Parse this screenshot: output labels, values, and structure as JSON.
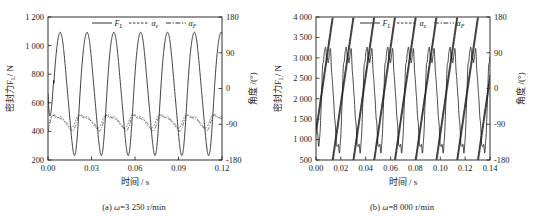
{
  "figure": {
    "panels": [
      {
        "id": "a",
        "caption_prefix": "(a) ",
        "caption_var": "ω",
        "caption_rest": "=3 250 r/min",
        "xlabel": "时间 / s",
        "ylabel_left": "密封力F",
        "ylabel_left_sub": "L",
        "ylabel_left_unit": "/ N",
        "ylabel_right": "角度 /(°)",
        "legend": [
          {
            "label": "F",
            "sub": "L",
            "style": "solid"
          },
          {
            "label": "α",
            "sub": "e",
            "style": "dashed"
          },
          {
            "label": "α",
            "sub": "F",
            "style": "dashdot"
          }
        ],
        "chart_data": {
          "type": "line",
          "title": "",
          "xlabel": "时间 / s",
          "ylabel": "密封力F_L / N",
          "ylabel_right": "角度 /(°)",
          "xlim": [
            0.0,
            0.12
          ],
          "ylim": [
            200,
            1200
          ],
          "ylim_right": [
            -180,
            180
          ],
          "xticks": [
            "0.00",
            "0.03",
            "0.06",
            "0.09",
            "0.12"
          ],
          "xtick_values": [
            0.0,
            0.03,
            0.06,
            0.09,
            0.12
          ],
          "yticks": [
            "200",
            "400",
            "600",
            "800",
            "1 000",
            "1 200"
          ],
          "ytick_values": [
            200,
            400,
            600,
            800,
            1000,
            1200
          ],
          "yticks_right": [
            "-180",
            "-90",
            "0",
            "90",
            "180"
          ],
          "ytick_right_values": [
            -180,
            -90,
            0,
            90,
            180
          ],
          "grid": false,
          "legend_position": "top-center",
          "series": [
            {
              "name": "F_L",
              "axis": "left",
              "style": "solid",
              "period": 0.0185,
              "min": 270,
              "max": 1110,
              "description": "Quasi-sinusoidal seal force, 6.5 cycles over 0-0.12 s, starting near 1150 N at t=0 and decaying into steady oscillation between about 270 N and 1110 N."
            },
            {
              "name": "alpha_e",
              "axis": "right",
              "style": "dashed",
              "period": 0.0185,
              "min": -98,
              "max": -60,
              "description": "Small-amplitude wavy curve near -90 deg, plotted in the band equivalent to 420-530 N on the left axis."
            },
            {
              "name": "alpha_F",
              "axis": "right",
              "style": "dashdot",
              "period": 0.0185,
              "min": -100,
              "max": -62,
              "description": "Nearly overlapping alpha_e, slightly lower, same period."
            }
          ]
        }
      },
      {
        "id": "b",
        "caption_prefix": "(b) ",
        "caption_var": "ω",
        "caption_rest": "=8 000 r/min",
        "xlabel": "时间 / s",
        "ylabel_left": "密封力F",
        "ylabel_left_sub": "L",
        "ylabel_left_unit": "/ N",
        "ylabel_right": "角度 /(°)",
        "legend": [
          {
            "label": "F",
            "sub": "L",
            "style": "solid"
          },
          {
            "label": "α",
            "sub": "e",
            "style": "dashed"
          },
          {
            "label": "α",
            "sub": "F",
            "style": "dashdot"
          }
        ],
        "chart_data": {
          "type": "line",
          "title": "",
          "xlabel": "时间 / s",
          "ylabel": "密封力F_L / N",
          "ylabel_right": "角度 /(°)",
          "xlim": [
            0.0,
            0.14
          ],
          "ylim": [
            500,
            4000
          ],
          "ylim_right": [
            -180,
            180
          ],
          "xticks": [
            "0.00",
            "0.02",
            "0.04",
            "0.06",
            "0.08",
            "0.10",
            "0.12",
            "0.14"
          ],
          "xtick_values": [
            0.0,
            0.02,
            0.04,
            0.06,
            0.08,
            0.1,
            0.12,
            0.14
          ],
          "yticks": [
            "500",
            "1 000",
            "1 500",
            "2 000",
            "2 500",
            "3 000",
            "3 500",
            "4 000"
          ],
          "ytick_values": [
            500,
            1000,
            1500,
            2000,
            2500,
            3000,
            3500,
            4000
          ],
          "yticks_right": [
            "-180",
            "-90",
            "0",
            "90",
            "180"
          ],
          "ytick_right_values": [
            -180,
            -90,
            0,
            90,
            180
          ],
          "grid": false,
          "legend_position": "top-center",
          "series": [
            {
              "name": "F_L",
              "axis": "left",
              "style": "solid",
              "period": 0.0167,
              "min": 700,
              "max": 3700,
              "description": "Jagged seal force with 8.5 cycles over 0-0.14 s, sharp peaks about 3500-3700 N with secondary shoulders, troughs about 700-900 N."
            },
            {
              "name": "alpha_e",
              "axis": "right",
              "style": "dashed",
              "period": 0.0167,
              "min": -180,
              "max": 180,
              "description": "Sawtooth ramp rising from -180 deg to +180 deg each revolution, drawn as a dense dotted line."
            },
            {
              "name": "alpha_F",
              "axis": "right",
              "style": "dashdot",
              "period": 0.0167,
              "min": -180,
              "max": 180,
              "description": "Sawtooth ramp nearly coincident with alpha_e, slightly phase shifted."
            }
          ]
        }
      }
    ]
  }
}
